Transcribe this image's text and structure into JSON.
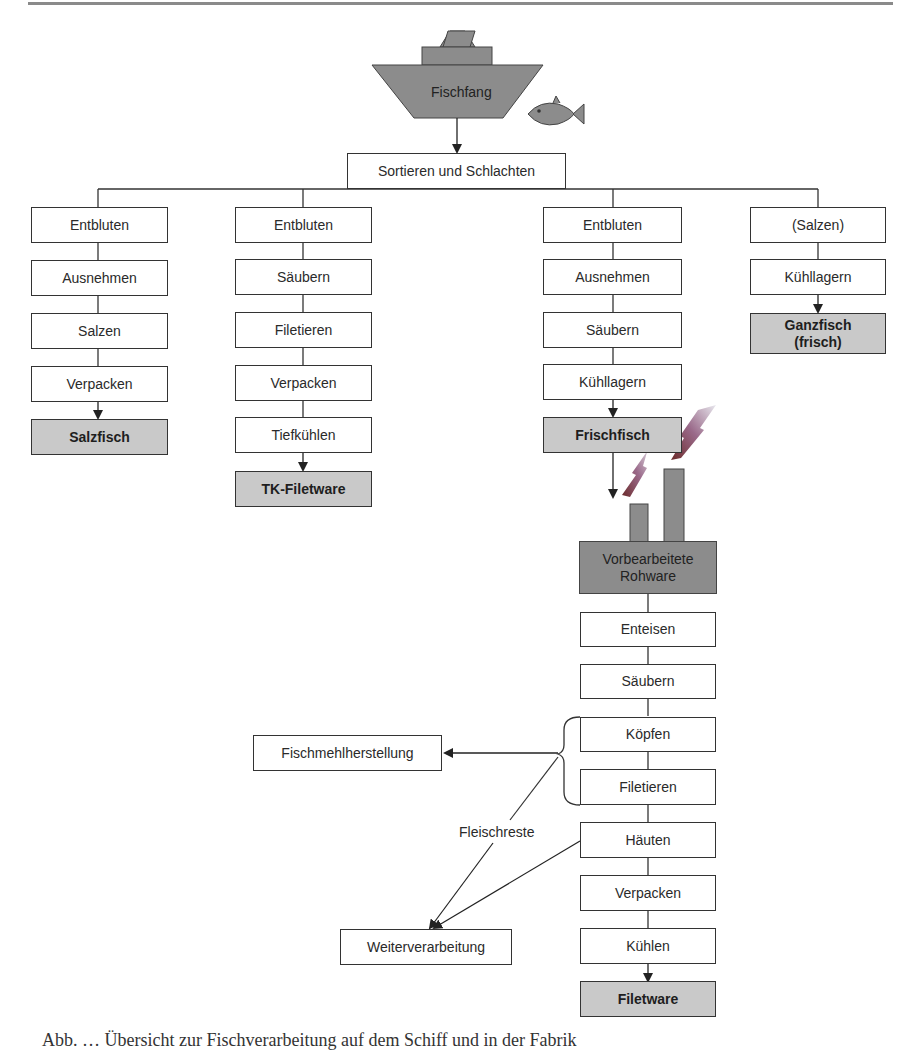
{
  "figure": {
    "source": "Fischfang",
    "sort_step": "Sortieren und Schlachten",
    "branches": [
      {
        "steps": [
          "Entbluten",
          "Ausnehmen",
          "Salzen",
          "Verpacken"
        ],
        "product": "Salzfisch"
      },
      {
        "steps": [
          "Entbluten",
          "Säubern",
          "Filetieren",
          "Verpacken",
          "Tiefkühlen"
        ],
        "product": "TK-Filetware"
      },
      {
        "steps": [
          "Entbluten",
          "Ausnehmen",
          "Säubern",
          "Kühllagern"
        ],
        "product": "Frischfisch"
      },
      {
        "steps": [
          "(Salzen)",
          "Kühllagern"
        ],
        "product": "Ganzfisch (frisch)"
      }
    ],
    "factory": {
      "input": "Vorbearbeitete Rohware",
      "steps": [
        "Enteisen",
        "Säubern",
        "Köpfen",
        "Filetieren",
        "Häuten",
        "Verpacken",
        "Kühlen"
      ],
      "product": "Filetware"
    },
    "side_outputs": {
      "fishmeal": "Fischmehlherstellung",
      "further_processing": "Weiterverarbeitung",
      "residue_label": "Fleischreste"
    },
    "icons": [
      "ship-icon",
      "fish-icon",
      "factory-icon",
      "lightning-icon"
    ],
    "colors": {
      "product_fill": "#c9c9c9",
      "ship_fill": "#8c8c8c",
      "line": "#333333"
    }
  },
  "caption": "Abb. … Übersicht zur Fischverarbeitung auf dem Schiff und in der Fabrik"
}
